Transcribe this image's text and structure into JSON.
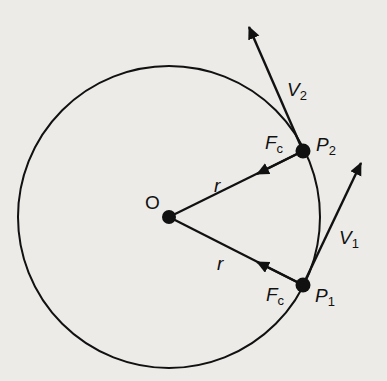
{
  "diagram": {
    "colors": {
      "background": "#ecebe8",
      "ink": "#111111"
    },
    "circle": {
      "cx": 169,
      "cy": 217,
      "r": 151
    },
    "center": {
      "label": "O",
      "x": 169,
      "y": 217
    },
    "points": [
      {
        "id": "P2",
        "label_main": "P",
        "label_sub": "2",
        "x": 303,
        "y": 151
      },
      {
        "id": "P1",
        "label_main": "P",
        "label_sub": "1",
        "x": 303,
        "y": 285
      }
    ],
    "radii": [
      {
        "label": "r",
        "from": "P2",
        "to": "O"
      },
      {
        "label": "r",
        "from": "P1",
        "to": "O"
      }
    ],
    "forces": [
      {
        "label_main": "F",
        "label_sub": "c",
        "at": "P2",
        "direction": "toward O"
      },
      {
        "label_main": "F",
        "label_sub": "c",
        "at": "P1",
        "direction": "toward O"
      }
    ],
    "velocities": [
      {
        "label_main": "V",
        "label_sub": "2",
        "at": "P2",
        "tip": [
          248,
          25
        ]
      },
      {
        "label_main": "V",
        "label_sub": "1",
        "at": "P1",
        "tip": [
          362,
          160
        ]
      }
    ]
  }
}
